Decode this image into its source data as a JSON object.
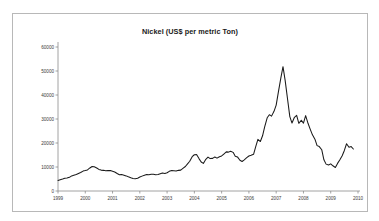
{
  "figure": {
    "background_color": "#ffffff",
    "frame_color": "#b8b8b8",
    "line_color": "#1a1a1a",
    "axis_color": "#8c8c8c"
  },
  "chart_data": {
    "type": "line",
    "title": "Nickel (US$ per metric Ton)",
    "xlabel": "",
    "ylabel": "",
    "ylim": [
      0,
      60000
    ],
    "xlim": [
      1999,
      2010
    ],
    "grid": false,
    "legend": "none",
    "ytick_labels": [
      "0",
      "10000",
      "20000",
      "30000",
      "40000",
      "50000",
      "60000"
    ],
    "ytick_values": [
      0,
      10000,
      20000,
      30000,
      40000,
      50000,
      60000
    ],
    "xtick_labels": [
      "1999",
      "2000",
      "2001",
      "2002",
      "2003",
      "2004",
      "2005",
      "2006",
      "2007",
      "2008",
      "2009",
      "2010"
    ],
    "xtick_values": [
      1999,
      2000,
      2001,
      2002,
      2003,
      2004,
      2005,
      2006,
      2007,
      2008,
      2009,
      2010
    ],
    "series": [
      {
        "name": "Nickel price",
        "x": [
          1999.0,
          1999.08,
          1999.17,
          1999.25,
          1999.33,
          1999.42,
          1999.5,
          1999.58,
          1999.67,
          1999.75,
          1999.83,
          1999.92,
          2000.0,
          2000.08,
          2000.17,
          2000.25,
          2000.33,
          2000.42,
          2000.5,
          2000.58,
          2000.67,
          2000.75,
          2000.83,
          2000.92,
          2001.0,
          2001.08,
          2001.17,
          2001.25,
          2001.33,
          2001.42,
          2001.5,
          2001.58,
          2001.67,
          2001.75,
          2001.83,
          2001.92,
          2002.0,
          2002.08,
          2002.17,
          2002.25,
          2002.33,
          2002.42,
          2002.5,
          2002.58,
          2002.67,
          2002.75,
          2002.83,
          2002.92,
          2003.0,
          2003.08,
          2003.17,
          2003.25,
          2003.33,
          2003.42,
          2003.5,
          2003.58,
          2003.67,
          2003.75,
          2003.83,
          2003.92,
          2004.0,
          2004.08,
          2004.17,
          2004.25,
          2004.33,
          2004.42,
          2004.5,
          2004.58,
          2004.67,
          2004.75,
          2004.83,
          2004.92,
          2005.0,
          2005.08,
          2005.17,
          2005.25,
          2005.33,
          2005.42,
          2005.5,
          2005.58,
          2005.67,
          2005.75,
          2005.83,
          2005.92,
          2006.0,
          2006.08,
          2006.17,
          2006.25,
          2006.33,
          2006.42,
          2006.5,
          2006.58,
          2006.67,
          2006.75,
          2006.83,
          2006.92,
          2007.0,
          2007.08,
          2007.17,
          2007.25,
          2007.33,
          2007.42,
          2007.5,
          2007.58,
          2007.67,
          2007.75,
          2007.83,
          2007.92,
          2008.0,
          2008.08,
          2008.17,
          2008.25,
          2008.33,
          2008.42,
          2008.5,
          2008.58,
          2008.67,
          2008.75,
          2008.83,
          2008.92,
          2009.0,
          2009.08,
          2009.17,
          2009.25,
          2009.33,
          2009.42,
          2009.5,
          2009.58,
          2009.67,
          2009.75,
          2009.83
        ],
        "values": [
          4400,
          4700,
          5000,
          5300,
          5400,
          5700,
          6300,
          6600,
          6900,
          7300,
          7700,
          8300,
          8500,
          8800,
          9600,
          10200,
          10100,
          9600,
          9000,
          8700,
          8600,
          8400,
          8500,
          8500,
          8200,
          7900,
          7300,
          6800,
          6900,
          6600,
          6300,
          5900,
          5500,
          5200,
          5100,
          5300,
          5800,
          6200,
          6600,
          6900,
          6800,
          7000,
          7000,
          6800,
          6900,
          7200,
          7500,
          7300,
          7600,
          8200,
          8500,
          8400,
          8300,
          8600,
          8700,
          9400,
          10200,
          11300,
          12400,
          14300,
          15100,
          15200,
          13500,
          12100,
          11500,
          13200,
          14100,
          13500,
          13600,
          14200,
          13700,
          14300,
          14600,
          15400,
          16300,
          16200,
          16600,
          16100,
          14500,
          14200,
          12800,
          12300,
          13000,
          13900,
          14600,
          14900,
          15300,
          18500,
          21500,
          20600,
          23000,
          26800,
          30500,
          31800,
          31200,
          33200,
          35800,
          41200,
          47000,
          51800,
          46000,
          38000,
          31000,
          28300,
          30700,
          31500,
          28200,
          29500,
          28300,
          31400,
          28100,
          25700,
          23400,
          21600,
          18900,
          18500,
          17200,
          13000,
          11200,
          10800,
          11300,
          10500,
          9800,
          11500,
          12900,
          14700,
          16900,
          19700,
          18200,
          18500,
          17500
        ]
      }
    ]
  }
}
